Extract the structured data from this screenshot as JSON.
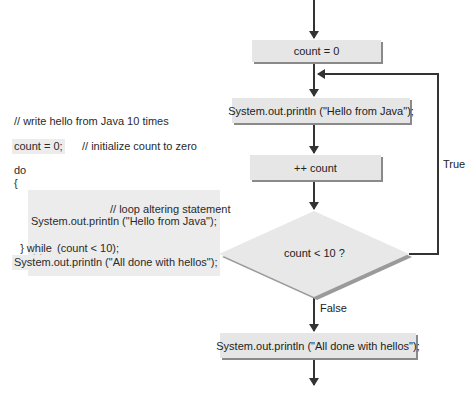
{
  "code": {
    "comment_header": "// write hello from Java 10 times",
    "init_stmt": "count = 0;",
    "init_comment": "// initialize count to zero",
    "do_kw": "do",
    "open_brace": "{",
    "body_print": "System.out.println (\"Hello from Java\");",
    "body_incr": "++ count;",
    "incr_comment": "// loop altering statement",
    "close_brace_while": "} while",
    "while_cond": "(count < 10);",
    "final_print": "System.out.println (\"All done with hellos\");"
  },
  "flowchart": {
    "init_box": "count = 0",
    "print_box": "System.out.println (\"Hello from Java\");",
    "incr_box": "++ count",
    "decision": "count < 10 ?",
    "true_label": "True",
    "false_label": "False",
    "final_box": "System.out.println (\"All done with hellos\");"
  },
  "colors": {
    "box_fill": "#e6e6e6",
    "box_shadow": "#8a8a8a",
    "line": "#333333"
  }
}
